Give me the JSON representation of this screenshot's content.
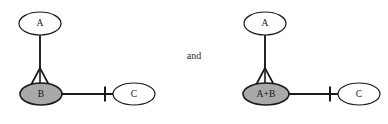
{
  "figure": {
    "kind": "uml-class-diagram-pair",
    "background_color": "#ffffff",
    "line_color": "#1a1a1a",
    "text_color": "#161616",
    "white_fill": "#ffffff",
    "gray_fill": "#a9a9a9",
    "conjunction": "and"
  },
  "diagrams": [
    {
      "id": "left-diagram",
      "name": "diagram-before-merge",
      "nodes": [
        {
          "id": "left-node-a",
          "label": "A",
          "fill": "#ffffff",
          "cx": 40,
          "cy": 23.5,
          "rx": 21,
          "ry": 11.5
        },
        {
          "id": "left-node-b",
          "label": "B",
          "fill": "#a9a9a9",
          "cx": 41,
          "cy": 94,
          "rx": 21,
          "ry": 11
        },
        {
          "id": "left-node-c",
          "label": "C",
          "fill": "#ffffff",
          "cx": 134,
          "cy": 94,
          "rx": 21,
          "ry": 11
        }
      ],
      "edges": [
        {
          "id": "left-edge-generalization",
          "from": "left-node-b",
          "to": "left-node-a",
          "decoration": "hollow-triangle-arrowhead",
          "orientation": "vertical"
        },
        {
          "id": "left-edge-association",
          "from": "left-node-b",
          "to": "left-node-c",
          "decoration": "tick-crossbar",
          "orientation": "horizontal"
        }
      ]
    },
    {
      "id": "right-diagram",
      "name": "diagram-after-merge",
      "nodes": [
        {
          "id": "right-node-a",
          "label": "A",
          "fill": "#ffffff",
          "cx": 265,
          "cy": 23.5,
          "rx": 21,
          "ry": 11.5
        },
        {
          "id": "right-node-ab",
          "label": "A+B",
          "fill": "#a9a9a9",
          "cx": 266,
          "cy": 94,
          "rx": 23,
          "ry": 11
        },
        {
          "id": "right-node-c",
          "label": "C",
          "fill": "#ffffff",
          "cx": 359,
          "cy": 94,
          "rx": 21,
          "ry": 11
        }
      ],
      "edges": [
        {
          "id": "right-edge-generalization",
          "from": "right-node-ab",
          "to": "right-node-a",
          "decoration": "hollow-triangle-arrowhead",
          "orientation": "vertical"
        },
        {
          "id": "right-edge-association",
          "from": "right-node-ab",
          "to": "right-node-c",
          "decoration": "tick-crossbar",
          "orientation": "horizontal"
        }
      ]
    }
  ]
}
